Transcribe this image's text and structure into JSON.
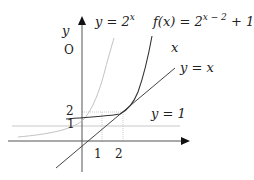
{
  "diagram": {
    "axes": {
      "x_label": "x",
      "y_label": "y",
      "origin_label": "O"
    },
    "curves": {
      "exp_label": "y = 2",
      "exp_sup": "x",
      "f_label": "f(x) = 2",
      "f_sup": "x − 2",
      "f_tail": " + 1",
      "line_label": "y = x",
      "asym_label": "y = 1",
      "x_mark": "x"
    },
    "ticks": {
      "x1": "1",
      "x2": "2",
      "y1": "1",
      "y2": "2"
    }
  },
  "colors": {
    "axis": "#555555",
    "curve": "#333333",
    "faint": "#bbbbbb",
    "grid": "#cccccc"
  }
}
